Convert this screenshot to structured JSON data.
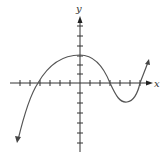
{
  "figure": {
    "type": "function-graph",
    "axes": {
      "x_label": "x",
      "y_label": "y",
      "x_ticks_left": 7,
      "x_ticks_right": 6,
      "y_ticks_above": 6,
      "y_ticks_below": 6,
      "tick_spacing_px": 10,
      "grid": false,
      "tick_labels": false
    },
    "curve": {
      "stroke_color": "#555555",
      "left_endpoint": {
        "x": -6.2,
        "y": -5.7,
        "arrow": true
      },
      "x_intercepts": [
        -4.2,
        3.0,
        6.0
      ],
      "y_intercept": 2.8,
      "local_max": {
        "x": 0.0,
        "y": 2.8
      },
      "local_min": {
        "x": 4.7,
        "y": -1.9
      },
      "right_endpoint": {
        "x": 6.8,
        "y": 2.1,
        "arrow": true
      }
    },
    "colors": {
      "axis": "#333333",
      "curve": "#555555",
      "background": "#ffffff"
    }
  }
}
